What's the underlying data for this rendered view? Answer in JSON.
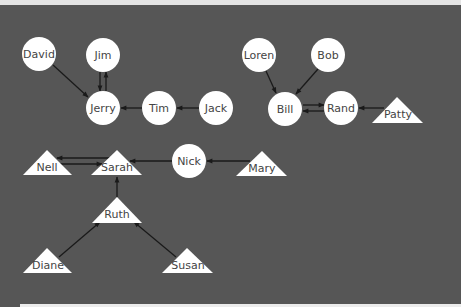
{
  "diagram": {
    "type": "directed-graph",
    "colors": {
      "background": "#565656",
      "node_fill": "#ffffff",
      "edge": "#1a1a1a",
      "label": "#444444"
    },
    "nodes": [
      {
        "id": "david",
        "label": "David",
        "shape": "circle",
        "x": 39,
        "y": 54
      },
      {
        "id": "jim",
        "label": "Jim",
        "shape": "circle",
        "x": 103,
        "y": 55
      },
      {
        "id": "jerry",
        "label": "Jerry",
        "shape": "circle",
        "x": 103,
        "y": 108
      },
      {
        "id": "tim",
        "label": "Tim",
        "shape": "circle",
        "x": 159,
        "y": 108
      },
      {
        "id": "jack",
        "label": "Jack",
        "shape": "circle",
        "x": 216,
        "y": 108
      },
      {
        "id": "loren",
        "label": "Loren",
        "shape": "circle",
        "x": 259,
        "y": 55
      },
      {
        "id": "bob",
        "label": "Bob",
        "shape": "circle",
        "x": 328,
        "y": 55
      },
      {
        "id": "bill",
        "label": "Bill",
        "shape": "circle",
        "x": 285,
        "y": 109
      },
      {
        "id": "rand",
        "label": "Rand",
        "shape": "circle",
        "x": 341,
        "y": 108
      },
      {
        "id": "patty",
        "label": "Patty",
        "shape": "triangle",
        "x": 397,
        "y": 113
      },
      {
        "id": "nell",
        "label": "Nell",
        "shape": "triangle",
        "x": 47,
        "y": 166
      },
      {
        "id": "sarah",
        "label": "Sarah",
        "shape": "triangle",
        "x": 117,
        "y": 166
      },
      {
        "id": "nick",
        "label": "Nick",
        "shape": "circle",
        "x": 189,
        "y": 161
      },
      {
        "id": "mary",
        "label": "Mary",
        "shape": "triangle",
        "x": 262,
        "y": 167
      },
      {
        "id": "ruth",
        "label": "Ruth",
        "shape": "triangle",
        "x": 117,
        "y": 213
      },
      {
        "id": "diane",
        "label": "Diane",
        "shape": "triangle",
        "x": 47,
        "y": 264
      },
      {
        "id": "susan",
        "label": "Susan",
        "shape": "triangle",
        "x": 187,
        "y": 264
      }
    ],
    "edges": [
      {
        "from": "David",
        "to": "Jerry"
      },
      {
        "from": "Jim",
        "to": "Jerry"
      },
      {
        "from": "Jerry",
        "to": "Jim"
      },
      {
        "from": "Tim",
        "to": "Jerry"
      },
      {
        "from": "Jack",
        "to": "Tim"
      },
      {
        "from": "Loren",
        "to": "Bill"
      },
      {
        "from": "Bob",
        "to": "Bill"
      },
      {
        "from": "Bill",
        "to": "Rand"
      },
      {
        "from": "Rand",
        "to": "Bill"
      },
      {
        "from": "Patty",
        "to": "Rand"
      },
      {
        "from": "Sarah",
        "to": "Nell"
      },
      {
        "from": "Nell",
        "to": "Sarah"
      },
      {
        "from": "Nick",
        "to": "Sarah"
      },
      {
        "from": "Mary",
        "to": "Nick"
      },
      {
        "from": "Ruth",
        "to": "Sarah"
      },
      {
        "from": "Diane",
        "to": "Ruth"
      },
      {
        "from": "Susan",
        "to": "Ruth"
      }
    ]
  }
}
